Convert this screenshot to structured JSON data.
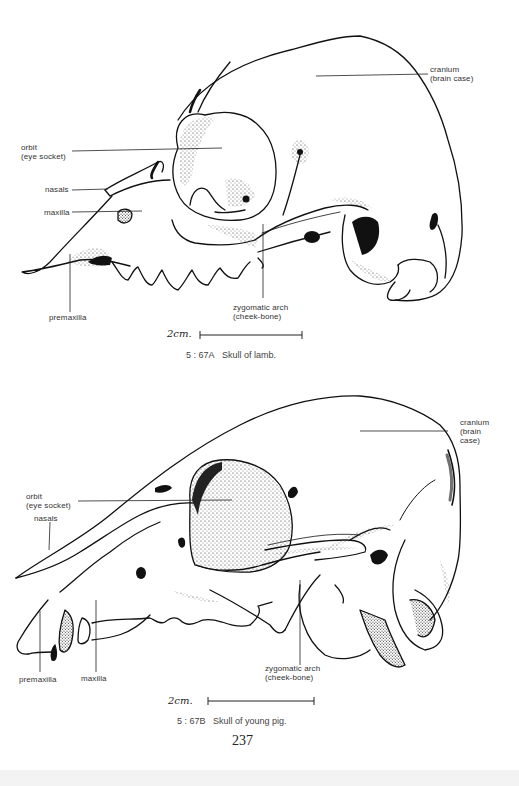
{
  "figures": [
    {
      "id": "5:67A",
      "caption_number": "5 : 67A",
      "caption_text": "Skull of lamb.",
      "scale_bar_label": "2cm.",
      "labels": {
        "cranium": "cranium",
        "cranium_sub": "(brain case)",
        "orbit": "orbit",
        "orbit_sub": "(eye socket)",
        "nasals": "nasals",
        "maxilla": "maxilla",
        "premaxilla": "premaxilla",
        "zygomatic": "zygomatic arch",
        "zygomatic_sub": "(cheek-bone)"
      }
    },
    {
      "id": "5:67B",
      "caption_number": "5 : 67B",
      "caption_text": "Skull of young pig.",
      "scale_bar_label": "2cm.",
      "labels": {
        "cranium": "cranium",
        "cranium_sub1": "(brain",
        "cranium_sub2": "case)",
        "orbit": "orbit",
        "orbit_sub": "(eye socket)",
        "nasals": "nasals",
        "premaxilla": "premaxilla",
        "maxilla": "maxilla",
        "zygomatic": "zygomatic arch",
        "zygomatic_sub": "(cheek-bone)"
      }
    }
  ],
  "page_number": "237",
  "colors": {
    "ink": "#111111",
    "label_text": "#333333",
    "paper": "#ffffff"
  }
}
